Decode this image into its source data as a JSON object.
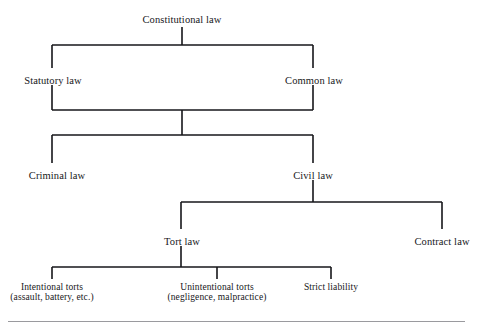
{
  "diagram": {
    "type": "tree-diagram",
    "background": "#ffffff",
    "line_color": "#16161a",
    "text_color": "#17171a",
    "rule_color": "#9a9a9e",
    "nodes": [
      {
        "id": "constitutional-law",
        "label": "Constitutional law",
        "sublabel": "",
        "x": 182,
        "y": 14,
        "font_size": 10.5,
        "level": 0
      },
      {
        "id": "statutory-law",
        "label": "Statutory law",
        "sublabel": "",
        "x": 53,
        "y": 75,
        "font_size": 10.5,
        "level": 1
      },
      {
        "id": "common-law",
        "label": "Common law",
        "sublabel": "",
        "x": 314,
        "y": 75,
        "font_size": 10.5,
        "level": 1
      },
      {
        "id": "criminal-law",
        "label": "Criminal law",
        "sublabel": "",
        "x": 57,
        "y": 170,
        "font_size": 10.5,
        "level": 2
      },
      {
        "id": "civil-law",
        "label": "Civil law",
        "sublabel": "",
        "x": 313,
        "y": 170,
        "font_size": 10.5,
        "level": 2
      },
      {
        "id": "tort-law",
        "label": "Tort law",
        "sublabel": "",
        "x": 182,
        "y": 236,
        "font_size": 10.5,
        "level": 3
      },
      {
        "id": "contract-law",
        "label": "Contract law",
        "sublabel": "",
        "x": 442,
        "y": 236,
        "font_size": 10.5,
        "level": 3
      },
      {
        "id": "intentional-torts",
        "label": "Intentional torts",
        "sublabel": "(assault, battery, etc.)",
        "x": 52,
        "y": 283,
        "font_size": 9.5,
        "level": 4
      },
      {
        "id": "unintentional-torts",
        "label": "Unintentional torts",
        "sublabel": "(negligence, malpractice)",
        "x": 217,
        "y": 283,
        "font_size": 9.5,
        "level": 4
      },
      {
        "id": "strict-liability",
        "label": "Strict liability",
        "sublabel": "",
        "x": 331,
        "y": 283,
        "font_size": 9.5,
        "level": 4
      }
    ],
    "edges": [
      {
        "id": "edge-constitutional-stem",
        "from": "constitutional-law",
        "to": "split-bar-1",
        "points": "182,27 182,45"
      },
      {
        "id": "edge-split-bar-1",
        "from": "constitutional-law",
        "to": "statutory-law,common-law",
        "points": "52,45 313,45"
      },
      {
        "id": "edge-drop-statutory",
        "from": "split-bar-1",
        "to": "statutory-law",
        "points": "52,45 52,68"
      },
      {
        "id": "edge-drop-common",
        "from": "split-bar-1",
        "to": "common-law",
        "points": "313,45 313,68"
      },
      {
        "id": "edge-rise-statutory",
        "from": "statutory-law",
        "to": "merge-bar-1",
        "points": "52,85 52,110"
      },
      {
        "id": "edge-rise-common",
        "from": "common-law",
        "to": "merge-bar-1",
        "points": "313,85 313,110"
      },
      {
        "id": "edge-merge-bar-1",
        "from": "statutory-law,common-law",
        "to": "merge-stem-1",
        "points": "52,110 313,110"
      },
      {
        "id": "edge-merge-stem-1",
        "from": "merge-bar-1",
        "to": "split-bar-2",
        "points": "182,110 182,135"
      },
      {
        "id": "edge-split-bar-2",
        "from": "merge-stem-1",
        "to": "criminal-law,civil-law",
        "points": "52,135 313,135"
      },
      {
        "id": "edge-drop-criminal",
        "from": "split-bar-2",
        "to": "criminal-law",
        "points": "52,135 52,163"
      },
      {
        "id": "edge-drop-civil",
        "from": "split-bar-2",
        "to": "civil-law",
        "points": "313,135 313,163"
      },
      {
        "id": "edge-civil-stem",
        "from": "civil-law",
        "to": "split-bar-3",
        "points": "313,180 313,202"
      },
      {
        "id": "edge-split-bar-3",
        "from": "civil-law",
        "to": "tort-law,contract-law",
        "points": "181,202 442,202"
      },
      {
        "id": "edge-drop-tort",
        "from": "split-bar-3",
        "to": "tort-law",
        "points": "181,202 181,229"
      },
      {
        "id": "edge-drop-contract",
        "from": "split-bar-3",
        "to": "contract-law",
        "points": "442,202 442,229"
      },
      {
        "id": "edge-tort-stem",
        "from": "tort-law",
        "to": "split-bar-4",
        "points": "181,246 181,267"
      },
      {
        "id": "edge-split-bar-4",
        "from": "tort-law",
        "to": "intentional-torts,unintentional-torts,strict-liability",
        "points": "52,267 331,267"
      },
      {
        "id": "edge-drop-intentional",
        "from": "split-bar-4",
        "to": "intentional-torts",
        "points": "52,267 52,279"
      },
      {
        "id": "edge-drop-unintentional",
        "from": "split-bar-4",
        "to": "unintentional-torts",
        "points": "217,267 217,279"
      },
      {
        "id": "edge-drop-strict",
        "from": "split-bar-4",
        "to": "strict-liability",
        "points": "331,267 331,279"
      }
    ],
    "bottom_rule": {
      "x": 8,
      "y": 321,
      "width": 457,
      "height": 1.4
    }
  }
}
